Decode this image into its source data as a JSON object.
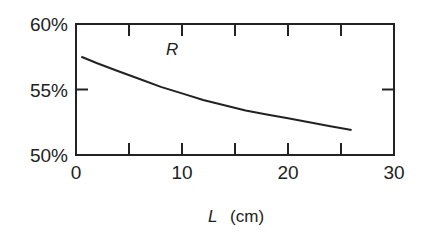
{
  "chart_data": {
    "type": "line",
    "title": "",
    "xlabel": "L (cm)",
    "xlabel_var": "L",
    "xlabel_unit": "(cm)",
    "ylabel": "",
    "xlim": [
      0,
      30
    ],
    "ylim": [
      50,
      60
    ],
    "x_ticks": [
      0,
      10,
      20,
      30
    ],
    "x_tick_labels": [
      "0",
      "10",
      "20",
      "30"
    ],
    "x_minor_ticks": [
      5,
      15,
      25
    ],
    "y_ticks": [
      50,
      55,
      60
    ],
    "y_tick_labels": [
      "50%",
      "55%",
      "60%"
    ],
    "grid": false,
    "legend": "none",
    "series": [
      {
        "name": "R",
        "x": [
          0.5,
          2,
          4,
          6,
          8,
          10,
          12,
          14,
          16,
          18,
          20,
          22,
          24,
          26
        ],
        "values": [
          57.5,
          57.0,
          56.4,
          55.8,
          55.2,
          54.7,
          54.2,
          53.8,
          53.4,
          53.1,
          52.8,
          52.5,
          52.2,
          51.9
        ]
      }
    ],
    "annotations": [
      {
        "text": "R",
        "x": 8.5,
        "y": 57.6
      }
    ]
  }
}
